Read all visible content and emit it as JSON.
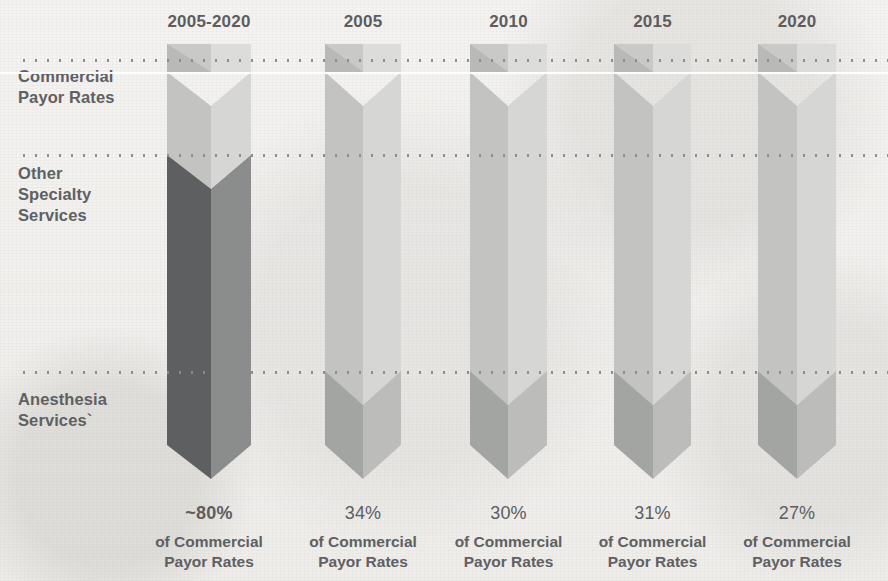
{
  "chart_data": {
    "type": "bar",
    "title": "",
    "subtitle": "",
    "xlabel": "",
    "ylabel": "",
    "categories": [
      "2005-2020",
      "2005",
      "2010",
      "2015",
      "2020"
    ],
    "series": [
      {
        "name": "Anesthesia Services",
        "values": [
          80,
          34,
          30,
          31,
          27
        ],
        "value_labels": [
          "~80%",
          "34%",
          "30%",
          "31%",
          "27%"
        ],
        "color": "#6f7173"
      }
    ],
    "axis_band_labels": [
      "Commercial Payor Rates",
      "Other Specialty Services",
      "Anesthesia Services`"
    ],
    "value_suffix": "of Commercial Payor Rates",
    "grid": true,
    "legend": "none"
  },
  "header": {
    "years": [
      {
        "label": "2005-2020"
      },
      {
        "label": "2005"
      },
      {
        "label": "2010"
      },
      {
        "label": "2015"
      },
      {
        "label": "2020"
      }
    ]
  },
  "axis": {
    "bands": [
      {
        "label": "Commercial\nPayor Rates",
        "line1": "Commercial",
        "line2": "Payor Rates"
      },
      {
        "label": "Other Specialty Services",
        "line1": "Other",
        "line2": "Specialty",
        "line3": "Services"
      },
      {
        "label": "Anesthesia Services`",
        "line1": "Anesthesia",
        "line2": "Services`"
      }
    ]
  },
  "bars": [
    {
      "year": "2005-2020",
      "percent_label": "~80%",
      "sub_line1": "of Commercial",
      "sub_line2": "Payor Rates",
      "emphasis": true
    },
    {
      "year": "2005",
      "percent_label": "34%",
      "sub_line1": "of Commercial",
      "sub_line2": "Payor Rates",
      "emphasis": false
    },
    {
      "year": "2010",
      "percent_label": "30%",
      "sub_line1": "of Commercial",
      "sub_line2": "Payor Rates",
      "emphasis": false
    },
    {
      "year": "2015",
      "percent_label": "31%",
      "sub_line1": "of Commercial",
      "sub_line2": "Payor Rates",
      "emphasis": false
    },
    {
      "year": "2020",
      "percent_label": "27%",
      "sub_line1": "of Commercial",
      "sub_line2": "Payor Rates",
      "emphasis": false
    }
  ],
  "colors": {
    "background": "#f2f1ef",
    "text": "#5d5d5f",
    "grid_dot": "#8b8b8d",
    "highlight_line": "#ffffff",
    "bar_light_left": "#c3c4c2",
    "bar_light_right": "#d6d7d4",
    "bar_dark_left": "#5d5f60",
    "bar_dark_right": "#8b8d8c",
    "bar_mid_left": "#a3a5a3",
    "bar_mid_right": "#bcbdba"
  }
}
